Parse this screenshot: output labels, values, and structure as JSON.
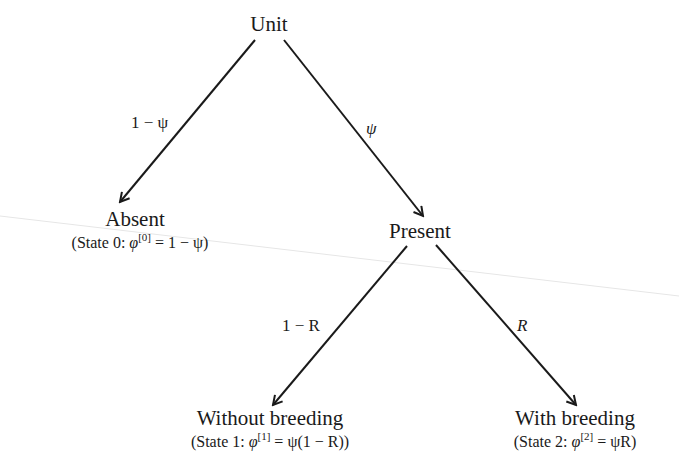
{
  "diagram": {
    "type": "probability-tree",
    "nodes": {
      "root": {
        "label": "Unit"
      },
      "absent": {
        "label": "Absent",
        "state": "(State 0:  φ[0] = 1 − ψ)",
        "state_prefix": "(State 0:  ",
        "phi": "φ",
        "sup": "[0]",
        "rhs": " = 1 − ψ)"
      },
      "present": {
        "label": "Present"
      },
      "without": {
        "label": "Without breeding",
        "state": "(State 1:  φ[1] = ψ(1 − R))",
        "state_prefix": "(State 1:  ",
        "phi": "φ",
        "sup": "[1]",
        "rhs": " = ψ(1 − R))"
      },
      "with": {
        "label": "With breeding",
        "state": "(State 2:  φ[2] = ψR)",
        "state_prefix": "(State 2:  ",
        "phi": "φ",
        "sup": "[2]",
        "rhs": " = ψR)"
      }
    },
    "edges": [
      {
        "from": "Unit",
        "to": "Absent",
        "label": "1 − ψ"
      },
      {
        "from": "Unit",
        "to": "Present",
        "label": "ψ"
      },
      {
        "from": "Present",
        "to": "Without breeding",
        "label": "1 − R"
      },
      {
        "from": "Present",
        "to": "With breeding",
        "label": "R"
      }
    ],
    "line_color": "#1a1a1a"
  }
}
